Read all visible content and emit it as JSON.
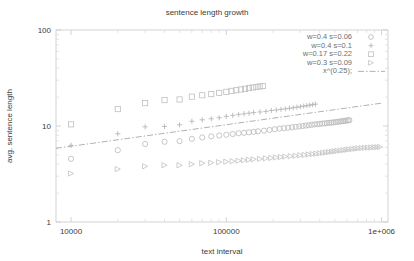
{
  "chart_data": {
    "type": "scatter",
    "title": "sentence length growth",
    "xlabel": "text interval",
    "ylabel": "avg. sentence length",
    "xscale": "log",
    "yscale": "log",
    "xlim": [
      8000,
      1100000
    ],
    "ylim": [
      1,
      100
    ],
    "grid": false,
    "legend_position": "top-right",
    "xticks": [
      {
        "value": 10000,
        "label": "10000"
      },
      {
        "value": 100000,
        "label": "100000"
      },
      {
        "value": 1000000,
        "label": "1e+006"
      }
    ],
    "yticks": [
      {
        "value": 1,
        "label": "1"
      },
      {
        "value": 10,
        "label": "10"
      },
      {
        "value": 100,
        "label": "100"
      }
    ],
    "series": [
      {
        "name": "w=0.4 s=0.06",
        "marker": "circle",
        "color": "#b9b9b9",
        "points": [
          [
            10000,
            4.55
          ],
          [
            20000,
            5.6
          ],
          [
            30000,
            6.5
          ],
          [
            40000,
            6.85
          ],
          [
            50000,
            6.95
          ],
          [
            60000,
            7.35
          ],
          [
            70000,
            7.6
          ],
          [
            80000,
            7.8
          ],
          [
            90000,
            7.95
          ],
          [
            100000,
            8.1
          ],
          [
            110000,
            8.25
          ],
          [
            120000,
            8.4
          ],
          [
            130000,
            8.5
          ],
          [
            140000,
            8.6
          ],
          [
            150000,
            8.7
          ],
          [
            160000,
            8.8
          ],
          [
            175000,
            8.95
          ],
          [
            190000,
            9.1
          ],
          [
            205000,
            9.25
          ],
          [
            220000,
            9.4
          ],
          [
            235000,
            9.5
          ],
          [
            250000,
            9.6
          ],
          [
            265000,
            9.7
          ],
          [
            280000,
            9.8
          ],
          [
            295000,
            9.9
          ],
          [
            310000,
            10.0
          ],
          [
            325000,
            10.1
          ],
          [
            340000,
            10.2
          ],
          [
            355000,
            10.3
          ],
          [
            370000,
            10.4
          ],
          [
            385000,
            10.45
          ],
          [
            400000,
            10.5
          ],
          [
            415000,
            10.6
          ],
          [
            430000,
            10.65
          ],
          [
            445000,
            10.7
          ],
          [
            460000,
            10.8
          ],
          [
            475000,
            10.85
          ],
          [
            490000,
            10.9
          ],
          [
            505000,
            11.0
          ],
          [
            520000,
            11.05
          ],
          [
            535000,
            11.1
          ],
          [
            550000,
            11.2
          ],
          [
            565000,
            11.25
          ],
          [
            580000,
            11.3
          ],
          [
            595000,
            11.4
          ],
          [
            610000,
            11.45
          ],
          [
            620000,
            11.5
          ]
        ]
      },
      {
        "name": "w=0.4 s=0.1",
        "marker": "plus",
        "color": "#b0b0b0",
        "points": [
          [
            10000,
            6.3
          ],
          [
            20000,
            8.3
          ],
          [
            30000,
            9.8
          ],
          [
            40000,
            9.9
          ],
          [
            50000,
            10.3
          ],
          [
            60000,
            11.2
          ],
          [
            70000,
            11.6
          ],
          [
            80000,
            11.9
          ],
          [
            90000,
            12.2
          ],
          [
            100000,
            12.6
          ],
          [
            110000,
            12.9
          ],
          [
            120000,
            13.2
          ],
          [
            130000,
            13.4
          ],
          [
            140000,
            13.6
          ],
          [
            150000,
            13.8
          ],
          [
            165000,
            14.0
          ],
          [
            180000,
            14.2
          ],
          [
            195000,
            14.5
          ],
          [
            210000,
            14.7
          ],
          [
            225000,
            14.9
          ],
          [
            240000,
            15.1
          ],
          [
            255000,
            15.3
          ],
          [
            270000,
            15.5
          ],
          [
            285000,
            15.7
          ],
          [
            300000,
            15.9
          ],
          [
            315000,
            16.1
          ],
          [
            330000,
            16.3
          ],
          [
            345000,
            16.5
          ],
          [
            360000,
            16.7
          ],
          [
            375000,
            16.9
          ]
        ]
      },
      {
        "name": "w=0.17 s=0.22",
        "marker": "square",
        "color": "#bfbfbf",
        "points": [
          [
            10000,
            10.4
          ],
          [
            20000,
            15.0
          ],
          [
            30000,
            17.3
          ],
          [
            40000,
            18.6
          ],
          [
            50000,
            18.9
          ],
          [
            60000,
            20.2
          ],
          [
            70000,
            20.9
          ],
          [
            80000,
            21.5
          ],
          [
            90000,
            22.1
          ],
          [
            100000,
            22.7
          ],
          [
            108000,
            23.2
          ],
          [
            116000,
            23.6
          ],
          [
            124000,
            24.0
          ],
          [
            132000,
            24.4
          ],
          [
            140000,
            24.8
          ],
          [
            148000,
            25.2
          ],
          [
            156000,
            25.5
          ],
          [
            164000,
            25.8
          ],
          [
            172000,
            26.1
          ]
        ]
      },
      {
        "name": "w=0.3 s=0.09",
        "marker": "triangle-right",
        "color": "#c2c2c2",
        "points": [
          [
            10000,
            3.2
          ],
          [
            20000,
            3.55
          ],
          [
            30000,
            3.8
          ],
          [
            40000,
            3.9
          ],
          [
            50000,
            3.9
          ],
          [
            60000,
            4.0
          ],
          [
            70000,
            4.1
          ],
          [
            80000,
            4.15
          ],
          [
            90000,
            4.2
          ],
          [
            100000,
            4.25
          ],
          [
            110000,
            4.3
          ],
          [
            120000,
            4.35
          ],
          [
            130000,
            4.4
          ],
          [
            140000,
            4.45
          ],
          [
            150000,
            4.5
          ],
          [
            165000,
            4.55
          ],
          [
            180000,
            4.6
          ],
          [
            195000,
            4.65
          ],
          [
            210000,
            4.7
          ],
          [
            225000,
            4.75
          ],
          [
            240000,
            4.8
          ],
          [
            260000,
            4.85
          ],
          [
            280000,
            4.9
          ],
          [
            300000,
            4.95
          ],
          [
            320000,
            5.0
          ],
          [
            340000,
            5.05
          ],
          [
            360000,
            5.1
          ],
          [
            380000,
            5.15
          ],
          [
            400000,
            5.2
          ],
          [
            420000,
            5.25
          ],
          [
            440000,
            5.3
          ],
          [
            460000,
            5.35
          ],
          [
            480000,
            5.4
          ],
          [
            500000,
            5.45
          ],
          [
            520000,
            5.5
          ],
          [
            545000,
            5.55
          ],
          [
            570000,
            5.6
          ],
          [
            595000,
            5.65
          ],
          [
            620000,
            5.7
          ],
          [
            650000,
            5.75
          ],
          [
            680000,
            5.8
          ],
          [
            710000,
            5.85
          ],
          [
            745000,
            5.9
          ],
          [
            780000,
            5.92
          ],
          [
            820000,
            5.95
          ],
          [
            860000,
            5.97
          ],
          [
            900000,
            6.0
          ],
          [
            940000,
            6.02
          ],
          [
            980000,
            6.05
          ]
        ]
      },
      {
        "name": "x^(0.25);",
        "marker": "line",
        "style": "dash-dot",
        "color": "#a8a8a8",
        "points": [
          [
            8000,
            5.85
          ],
          [
            1000000,
            17.3
          ]
        ]
      }
    ]
  },
  "legend": {
    "entries": [
      {
        "label": "w=0.4 s=0.06",
        "marker": "circle"
      },
      {
        "label": "w=0.4 s=0.1",
        "marker": "plus"
      },
      {
        "label": "w=0.17 s=0.22",
        "marker": "square"
      },
      {
        "label": "w=0.3 s=0.09",
        "marker": "triangle-right"
      },
      {
        "label": "x^(0.25);",
        "marker": "line"
      }
    ]
  }
}
